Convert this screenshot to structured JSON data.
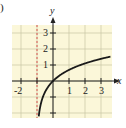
{
  "panel_label": ")",
  "chart_data": {
    "type": "line",
    "title": "",
    "function": "y = ln(x + 1)",
    "xlabel": "x",
    "ylabel": "y",
    "xlim": [
      -2.6,
      3.6
    ],
    "ylim": [
      -2.3,
      3.6
    ],
    "x_ticks": [
      -2,
      -1,
      1,
      2,
      3
    ],
    "x_tick_labels": [
      "-2",
      "1",
      "2",
      "3"
    ],
    "y_ticks": [
      -2,
      -1,
      1,
      2,
      3
    ],
    "y_tick_labels": [
      "1",
      "2",
      "3"
    ],
    "grid": true,
    "asymptote": {
      "type": "vertical",
      "x": -1,
      "style": "dashed",
      "color": "#d9534f"
    },
    "series": [
      {
        "name": "ln(x+1)",
        "x": [
          -0.9,
          -0.8,
          -0.6,
          -0.4,
          -0.2,
          0,
          0.5,
          1,
          1.5,
          2,
          2.5,
          3,
          3.5
        ],
        "values": [
          -2.3,
          -1.61,
          -0.92,
          -0.51,
          -0.22,
          0,
          0.41,
          0.69,
          0.92,
          1.1,
          1.25,
          1.39,
          1.5
        ]
      }
    ]
  },
  "colors": {
    "grid_bg": "#fbf7d9",
    "grid_line": "#c9c4a3",
    "axis": "#222222",
    "curve": "#1a1a1a",
    "asymptote": "#d9534f"
  }
}
